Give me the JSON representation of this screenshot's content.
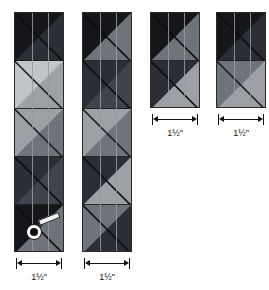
{
  "diagram": {
    "kind": "quilting-strip-sets",
    "background_color": "#ffffff",
    "unit_label": "1½\"",
    "palette": {
      "very_dark": "#15161a",
      "dark": "#2b2e35",
      "medium_dark": "#3f434b",
      "medium": "#6f737a",
      "light": "#9da1a6",
      "very_light": "#c3c6c9",
      "seam_line": "#9a9a9a",
      "outline": "#2a2a2a",
      "rule_ink": "#121212",
      "pin_head_fill": "#ffffff",
      "pin_head_center": "#101010",
      "pin_shaft": "#f2f2f2"
    },
    "strip_width_label": "1½\"",
    "segments_per_set": 3
  },
  "columns": [
    {
      "name": "strip-set-1",
      "x": 14,
      "y": 12,
      "width": 50,
      "height": 240,
      "seam_fractions": [
        0.3333,
        0.6667
      ],
      "has_pin": true,
      "measure": {
        "label": "1½\"",
        "x": 16,
        "y": 258,
        "width": 46
      },
      "blocks": [
        {
          "name": "block-1-1",
          "upper_left": "#15161a",
          "lower_right": "#2b2e35",
          "diagonal": "#0d0e10",
          "height": 48
        },
        {
          "name": "block-1-2",
          "upper_left": "#c3c6c9",
          "lower_right": "#9da1a6",
          "diagonal": "#1d1f22",
          "height": 48
        },
        {
          "name": "block-1-3",
          "upper_left": "#9da1a6",
          "lower_right": "#6f737a",
          "diagonal": "#1d1f22",
          "height": 48
        },
        {
          "name": "block-1-4",
          "upper_left": "#2b2e35",
          "lower_right": "#3f434b",
          "diagonal": "#0d0e10",
          "height": 48
        },
        {
          "name": "block-1-5",
          "upper_left": "#15161a",
          "lower_right": "#6f737a",
          "diagonal": "#0d0e10",
          "height": 48
        }
      ]
    },
    {
      "name": "strip-set-2",
      "x": 82,
      "y": 12,
      "width": 50,
      "height": 240,
      "seam_fractions": [
        0.3333,
        0.6667
      ],
      "has_pin": false,
      "measure": {
        "label": "1½\"",
        "x": 84,
        "y": 258,
        "width": 46
      },
      "blocks": [
        {
          "name": "block-2-1",
          "upper_left": "#15161a",
          "lower_right": "#6f737a",
          "diagonal": "#0d0e10",
          "height": 48
        },
        {
          "name": "block-2-2",
          "upper_left": "#2b2e35",
          "lower_right": "#3f434b",
          "diagonal": "#0d0e10",
          "height": 48
        },
        {
          "name": "block-2-3",
          "upper_left": "#9da1a6",
          "lower_right": "#6f737a",
          "diagonal": "#1d1f22",
          "height": 48
        },
        {
          "name": "block-2-4",
          "upper_left": "#2b2e35",
          "lower_right": "#9da1a6",
          "diagonal": "#0d0e10",
          "height": 48
        },
        {
          "name": "block-2-5",
          "upper_left": "#6f737a",
          "lower_right": "#2b2e35",
          "diagonal": "#0d0e10",
          "height": 48
        }
      ]
    },
    {
      "name": "strip-set-3",
      "x": 150,
      "y": 12,
      "width": 50,
      "height": 96,
      "seam_fractions": [
        0.3333,
        0.6667
      ],
      "has_pin": false,
      "measure": {
        "label": "1½\"",
        "x": 152,
        "y": 114,
        "width": 46
      },
      "blocks": [
        {
          "name": "block-3-1",
          "upper_left": "#15161a",
          "lower_right": "#6f737a",
          "diagonal": "#0d0e10",
          "height": 48
        },
        {
          "name": "block-3-2",
          "upper_left": "#2b2e35",
          "lower_right": "#9da1a6",
          "diagonal": "#0d0e10",
          "height": 48
        }
      ]
    },
    {
      "name": "strip-set-4",
      "x": 216,
      "y": 12,
      "width": 50,
      "height": 96,
      "seam_fractions": [
        0.3333,
        0.6667
      ],
      "has_pin": false,
      "measure": {
        "label": "1½\"",
        "x": 218,
        "y": 114,
        "width": 46
      },
      "blocks": [
        {
          "name": "block-4-1",
          "upper_left": "#15161a",
          "lower_right": "#2b2e35",
          "diagonal": "#0d0e10",
          "height": 48
        },
        {
          "name": "block-4-2",
          "upper_left": "#6f737a",
          "lower_right": "#9da1a6",
          "diagonal": "#1d1f22",
          "height": 48
        }
      ]
    }
  ],
  "pin": {
    "name": "straight-pin",
    "x": 26,
    "y": 216,
    "width": 40,
    "height": 28
  }
}
